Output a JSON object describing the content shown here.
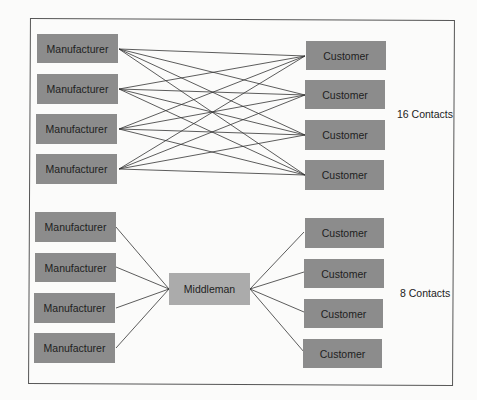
{
  "diagram": {
    "top": {
      "manufacturers": [
        {
          "label": "Manufacturer"
        },
        {
          "label": "Manufacturer"
        },
        {
          "label": "Manufacturer"
        },
        {
          "label": "Manufacturer"
        }
      ],
      "customers": [
        {
          "label": "Customer"
        },
        {
          "label": "Customer"
        },
        {
          "label": "Customer"
        },
        {
          "label": "Customer"
        }
      ],
      "contacts_label": "16 Contacts"
    },
    "bottom": {
      "manufacturers": [
        {
          "label": "Manufacturer"
        },
        {
          "label": "Manufacturer"
        },
        {
          "label": "Manufacturer"
        },
        {
          "label": "Manufacturer"
        }
      ],
      "middleman": {
        "label": "Middleman"
      },
      "customers": [
        {
          "label": "Customer"
        },
        {
          "label": "Customer"
        },
        {
          "label": "Customer"
        },
        {
          "label": "Customer"
        }
      ],
      "contacts_label": "8 Contacts"
    },
    "colors": {
      "box": "#8c8c8c",
      "middleman": "#ababab",
      "line": "#333333"
    }
  }
}
